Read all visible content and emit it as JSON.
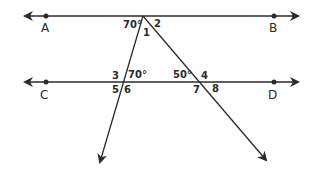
{
  "diagram": {
    "type": "parallel-lines-with-transversals",
    "colors": {
      "line": "#2a2a2a",
      "text": "#2a2a2a",
      "background": "#ffffff"
    },
    "points": [
      {
        "name": "A",
        "label": "A",
        "x": 46,
        "y": 16
      },
      {
        "name": "B",
        "label": "B",
        "x": 274,
        "y": 16
      },
      {
        "name": "C",
        "label": "C",
        "x": 46,
        "y": 82
      },
      {
        "name": "D",
        "label": "D",
        "x": 274,
        "y": 82
      }
    ],
    "lines": [
      {
        "name": "line-AB",
        "x1": 25,
        "y1": 16,
        "x2": 298,
        "y2": 16,
        "arrows": "both"
      },
      {
        "name": "line-CD",
        "x1": 25,
        "y1": 82,
        "x2": 298,
        "y2": 82,
        "arrows": "both"
      },
      {
        "name": "transversal-left",
        "x1": 143,
        "y1": 16,
        "x2": 100,
        "y2": 162,
        "arrows": "end"
      },
      {
        "name": "transversal-right",
        "x1": 143,
        "y1": 16,
        "x2": 266,
        "y2": 160,
        "arrows": "end"
      }
    ],
    "angle_labels": {
      "top_left": "70°",
      "angle1": "1",
      "angle2": "2",
      "angle3": "3",
      "mid_left": "70°",
      "angle5": "5",
      "angle6": "6",
      "mid_right": "50°",
      "angle4": "4",
      "angle7": "7",
      "angle8": "8"
    }
  }
}
